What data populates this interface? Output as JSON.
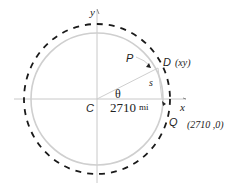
{
  "figure": {
    "axes": {
      "x_label": "x",
      "y_label": "y"
    },
    "points": {
      "center": "C",
      "P": "P",
      "D": "D",
      "D_coords": "(xy)",
      "Q": "Q",
      "Q_coords": "(2710 ,0)"
    },
    "labels": {
      "angle": "θ",
      "arc": "s",
      "radius_value": "2710",
      "radius_unit": "mi"
    },
    "colors": {
      "inner_circle": "#cfcfcf",
      "orbit": "#1a1a1a",
      "axes": "#c8c8c8",
      "text": "#222222"
    }
  }
}
